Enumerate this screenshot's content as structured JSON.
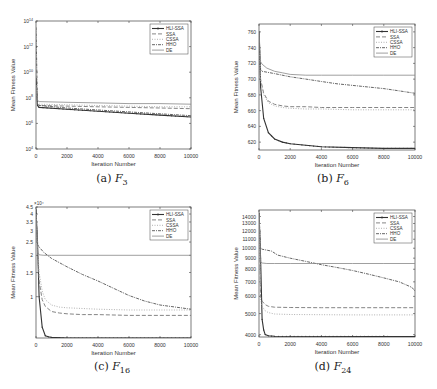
{
  "chart_data": [
    {
      "id": "a",
      "type": "line",
      "caption_label": "(a)",
      "caption_func": "F",
      "caption_sub": "3",
      "xlabel": "Iteration Number",
      "ylabel": "Mean Fitness Value",
      "yscale": "log",
      "xlim": [
        0,
        10000
      ],
      "ylim_exp": [
        4,
        14
      ],
      "xticks": [
        "0",
        "2000",
        "4000",
        "6000",
        "8000",
        "10000"
      ],
      "yticks_exp": [
        4,
        6,
        8,
        10,
        12,
        14
      ],
      "legend": [
        "HLI-SSA",
        "SSA",
        "CSSA",
        "HHO",
        "DE"
      ],
      "legend_position": "upper right",
      "series": [
        {
          "name": "HLI-SSA",
          "x": [
            0,
            100,
            200,
            2000,
            4000,
            6000,
            8000,
            10000
          ],
          "log10y": [
            9.5,
            7.4,
            7.25,
            7.1,
            6.95,
            6.8,
            6.65,
            6.5
          ]
        },
        {
          "name": "SSA",
          "x": [
            0,
            100,
            200,
            2000,
            4000,
            6000,
            8000,
            10000
          ],
          "log10y": [
            9.0,
            7.5,
            7.4,
            7.35,
            7.3,
            7.25,
            7.2,
            7.15
          ]
        },
        {
          "name": "CSSA",
          "x": [
            0,
            100,
            200,
            2000,
            4000,
            6000,
            8000,
            10000
          ],
          "log10y": [
            9.0,
            7.6,
            7.5,
            7.45,
            7.4,
            7.35,
            7.3,
            7.3
          ]
        },
        {
          "name": "HHO",
          "x": [
            0,
            100,
            200,
            2000,
            4000,
            6000,
            8000,
            10000
          ],
          "log10y": [
            13.5,
            7.5,
            7.4,
            7.2,
            7.05,
            6.9,
            6.75,
            6.6
          ]
        },
        {
          "name": "DE",
          "x": [
            0,
            100,
            200,
            2000,
            4000,
            6000,
            8000,
            10000
          ],
          "log10y": [
            9.0,
            7.8,
            7.7,
            7.65,
            7.6,
            7.55,
            7.55,
            7.5
          ]
        }
      ]
    },
    {
      "id": "b",
      "type": "line",
      "caption_label": "(b)",
      "caption_func": "F",
      "caption_sub": "6",
      "xlabel": "Iteration Number",
      "ylabel": "Mean Fitness Value",
      "yscale": "linear",
      "xlim": [
        0,
        10000
      ],
      "ylim": [
        610,
        770
      ],
      "xticks": [
        "0",
        "2000",
        "4000",
        "6000",
        "8000",
        "10000"
      ],
      "yticks": [
        620,
        640,
        660,
        680,
        700,
        720,
        740,
        760
      ],
      "legend": [
        "HLI-SSA",
        "SSA",
        "CSSA",
        "HHO",
        "DE"
      ],
      "legend_position": "upper right",
      "series": [
        {
          "name": "HLI-SSA",
          "x": [
            0,
            100,
            300,
            600,
            1000,
            1500,
            2000,
            3000,
            4000,
            6000,
            8000,
            10000
          ],
          "y": [
            760,
            690,
            650,
            632,
            624,
            620,
            618,
            616,
            614,
            613,
            612,
            612
          ]
        },
        {
          "name": "SSA",
          "x": [
            0,
            100,
            300,
            600,
            1000,
            1500,
            2000,
            3000,
            4000,
            6000,
            8000,
            10000
          ],
          "y": [
            740,
            700,
            682,
            672,
            668,
            666,
            665,
            665,
            664,
            664,
            664,
            664
          ]
        },
        {
          "name": "CSSA",
          "x": [
            0,
            100,
            300,
            600,
            1000,
            1500,
            2000,
            3000,
            4000,
            6000,
            8000,
            10000
          ],
          "y": [
            740,
            698,
            680,
            670,
            666,
            664,
            663,
            662,
            662,
            661,
            661,
            661
          ]
        },
        {
          "name": "HHO",
          "x": [
            0,
            100,
            200,
            1000,
            2000,
            3000,
            4000,
            5000,
            6000,
            7000,
            8000,
            9000,
            10000
          ],
          "y": [
            760,
            712,
            710,
            707,
            703,
            700,
            697,
            694,
            692,
            690,
            688,
            685,
            682
          ]
        },
        {
          "name": "DE",
          "x": [
            0,
            100,
            200,
            500,
            1000,
            1500,
            2000,
            3000,
            4000,
            6000,
            8000,
            10000
          ],
          "y": [
            760,
            722,
            719,
            714,
            710,
            708,
            706,
            705,
            705,
            705,
            705,
            705
          ]
        }
      ]
    },
    {
      "id": "c",
      "type": "line",
      "caption_label": "(c)",
      "caption_func": "F",
      "caption_sub": "16",
      "xlabel": "Iteration Number",
      "ylabel": "Mean Fitness Value",
      "y_multiplier": "×10⁴",
      "yscale": "log",
      "xlim": [
        0,
        10000
      ],
      "ylim": [
        0.5,
        4.5
      ],
      "xticks": [
        "0",
        "2000",
        "4000",
        "6000",
        "8000",
        "10000"
      ],
      "yticks": [
        1,
        1.5,
        2,
        2.5,
        3,
        3.5,
        4,
        4.5
      ],
      "ytick_labels": [
        "1",
        "1.5",
        "2",
        "2.5",
        "3",
        "3.5",
        "4",
        "4.5"
      ],
      "legend": [
        "HLI-SSA",
        "SSA",
        "CSSA",
        "HHO",
        "DE"
      ],
      "legend_position": "upper right",
      "series": [
        {
          "name": "HLI-SSA",
          "x": [
            0,
            100,
            200,
            400,
            600,
            800,
            1000,
            2000,
            10000
          ],
          "y": [
            4.3,
            2.5,
            1.0,
            0.6,
            0.52,
            0.51,
            0.505,
            0.5,
            0.5
          ]
        },
        {
          "name": "SSA",
          "x": [
            0,
            200,
            400,
            600,
            1000,
            1500,
            2000,
            3000,
            4000,
            6000,
            8000,
            10000
          ],
          "y": [
            4.0,
            1.3,
            0.95,
            0.85,
            0.78,
            0.76,
            0.75,
            0.74,
            0.74,
            0.73,
            0.73,
            0.73
          ]
        },
        {
          "name": "CSSA",
          "x": [
            0,
            200,
            400,
            600,
            1000,
            1500,
            2000,
            3000,
            4000,
            6000,
            8000,
            10000
          ],
          "y": [
            4.0,
            1.5,
            1.1,
            0.95,
            0.87,
            0.84,
            0.83,
            0.82,
            0.81,
            0.8,
            0.8,
            0.8
          ]
        },
        {
          "name": "HHO",
          "x": [
            0,
            100,
            200,
            500,
            1000,
            2000,
            3000,
            4000,
            5000,
            6000,
            7000,
            8000,
            9000,
            10000
          ],
          "y": [
            4.0,
            2.4,
            2.3,
            2.1,
            1.9,
            1.65,
            1.45,
            1.3,
            1.15,
            1.02,
            0.93,
            0.87,
            0.84,
            0.81
          ]
        },
        {
          "name": "DE",
          "x": [
            0,
            100,
            200,
            500,
            1000,
            2000,
            4000,
            6000,
            8000,
            10000
          ],
          "y": [
            4.0,
            2.1,
            2.02,
            2.0,
            2.0,
            2.0,
            2.0,
            2.0,
            2.0,
            2.0
          ]
        }
      ]
    },
    {
      "id": "d",
      "type": "line",
      "caption_label": "(d)",
      "caption_func": "F",
      "caption_sub": "24",
      "xlabel": "Iteration Number",
      "ylabel": "Mean Fitness Value",
      "yscale": "log",
      "xlim": [
        0,
        10000
      ],
      "ylim": [
        3900,
        15000
      ],
      "xticks": [
        "0",
        "2000",
        "4000",
        "6000",
        "8000",
        "10000"
      ],
      "yticks": [
        4000,
        5000,
        6000,
        7000,
        8000,
        9000,
        10000,
        11000,
        12000,
        13000,
        14000
      ],
      "legend": [
        "HLI-SSA",
        "SSA",
        "CSSA",
        "HHO",
        "DE"
      ],
      "legend_position": "upper right",
      "series": [
        {
          "name": "HLI-SSA",
          "x": [
            0,
            100,
            200,
            300,
            400,
            600,
            1000,
            10000
          ],
          "y": [
            14500,
            9000,
            4700,
            4200,
            4000,
            3950,
            3930,
            3920
          ]
        },
        {
          "name": "SSA",
          "x": [
            0,
            100,
            200,
            400,
            600,
            1000,
            2000,
            4000,
            6000,
            8000,
            10000
          ],
          "y": [
            14000,
            6000,
            5700,
            5500,
            5400,
            5350,
            5330,
            5320,
            5320,
            5320,
            5320
          ]
        },
        {
          "name": "CSSA",
          "x": [
            0,
            100,
            200,
            400,
            600,
            1000,
            2000,
            4000,
            6000,
            8000,
            10000
          ],
          "y": [
            14000,
            5800,
            5400,
            5150,
            5050,
            4980,
            4950,
            4940,
            4930,
            4930,
            4930
          ]
        },
        {
          "name": "HHO",
          "x": [
            0,
            100,
            200,
            800,
            1200,
            2000,
            3000,
            4000,
            5000,
            6000,
            7000,
            8000,
            9000,
            9800,
            10000
          ],
          "y": [
            14500,
            10000,
            9900,
            9700,
            9300,
            9000,
            8700,
            8400,
            8150,
            7900,
            7600,
            7300,
            7000,
            6600,
            6350
          ]
        },
        {
          "name": "DE",
          "x": [
            0,
            100,
            200,
            500,
            1000,
            2000,
            4000,
            6000,
            8000,
            10000
          ],
          "y": [
            14500,
            8650,
            8550,
            8500,
            8500,
            8500,
            8500,
            8500,
            8500,
            8500
          ]
        }
      ]
    }
  ],
  "styles": {
    "HLI-SSA": {
      "color": "#333333",
      "dash": "",
      "width": 1.1,
      "marker": true
    },
    "SSA": {
      "color": "#777777",
      "dash": "4,2",
      "width": 0.9,
      "marker": false
    },
    "CSSA": {
      "color": "#a8a8a8",
      "dash": "1,1.5",
      "width": 0.9,
      "marker": false
    },
    "HHO": {
      "color": "#555555",
      "dash": "3,1,1,1",
      "width": 0.9,
      "marker": false
    },
    "DE": {
      "color": "#888888",
      "dash": "",
      "width": 0.8,
      "marker": false
    }
  }
}
